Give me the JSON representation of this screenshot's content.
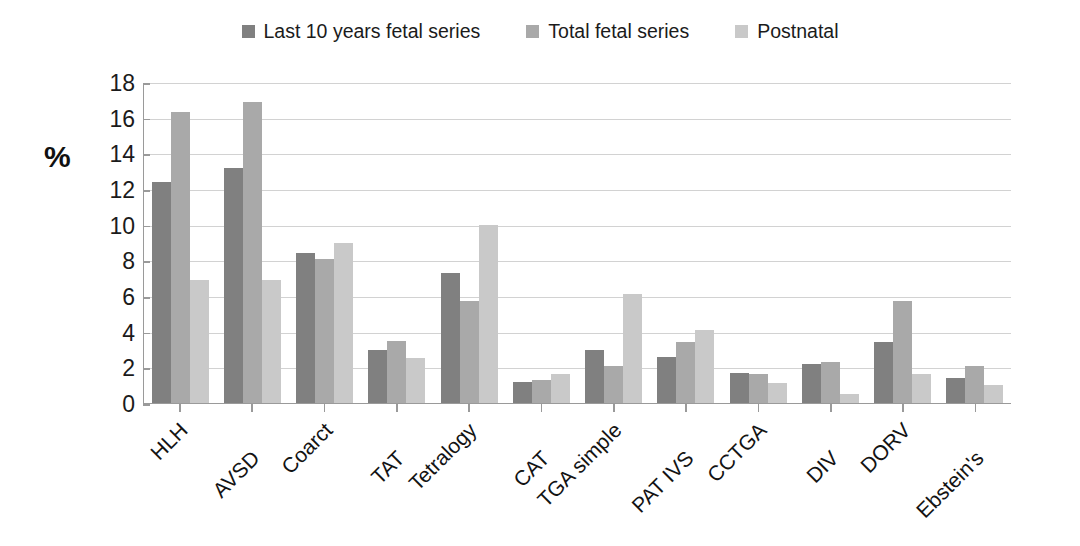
{
  "legend": {
    "position": "top-center",
    "items": [
      {
        "label": "Last 10 years fetal series",
        "color": "#808080",
        "icon": "square-swatch"
      },
      {
        "label": "Total fetal series",
        "color": "#a9a9a9",
        "icon": "square-swatch"
      },
      {
        "label": "Postnatal",
        "color": "#c9c9c9",
        "icon": "square-swatch"
      }
    ]
  },
  "axes": {
    "y_title": "%",
    "y_ticks": [
      "0",
      "2",
      "4",
      "6",
      "8",
      "10",
      "12",
      "14",
      "16",
      "18"
    ]
  },
  "chart_data": {
    "type": "bar",
    "title": "",
    "xlabel": "",
    "ylabel": "%",
    "ylim": [
      0,
      18
    ],
    "ytick_step": 2,
    "grid": true,
    "legend_position": "top-center",
    "categories": [
      "HLH",
      "AVSD",
      "Coarct",
      "TAT",
      "Tetralogy",
      "CAT",
      "TGA simple",
      "PAT IVS",
      "CCTGA",
      "DIV",
      "DORV",
      "Ebstein's"
    ],
    "series": [
      {
        "name": "Last 10 years fetal series",
        "color": "#808080",
        "values": [
          12.4,
          13.2,
          8.4,
          3.0,
          7.3,
          1.2,
          3.0,
          2.6,
          1.7,
          2.2,
          3.4,
          1.4
        ]
      },
      {
        "name": "Total fetal series",
        "color": "#a9a9a9",
        "values": [
          16.3,
          16.9,
          8.1,
          3.5,
          5.7,
          1.3,
          2.1,
          3.4,
          1.6,
          2.3,
          5.7,
          2.1
        ]
      },
      {
        "name": "Postnatal",
        "color": "#c9c9c9",
        "values": [
          6.9,
          6.9,
          9.0,
          2.5,
          10.0,
          1.6,
          6.1,
          4.1,
          1.1,
          0.5,
          1.6,
          1.0
        ]
      }
    ]
  }
}
